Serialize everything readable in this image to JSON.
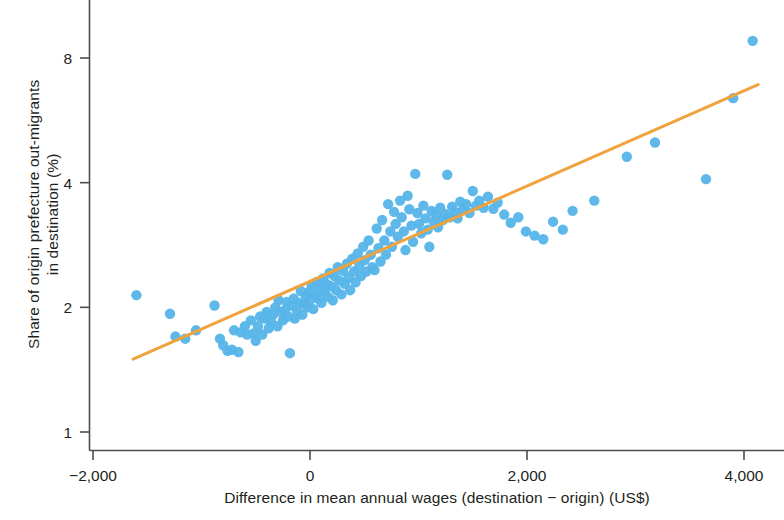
{
  "chart_data": {
    "type": "scatter",
    "title": "",
    "xlabel": "Difference in mean annual wages (destination − origin) (US$)",
    "ylabel": "Share of origin prefecture out-migrants in destination (%)",
    "xlabel_lines": [
      "Difference in mean annual wages (destination − origin) (US$)"
    ],
    "ylabel_lines": [
      "Share of origin prefecture out-migrants",
      "in destination (%)"
    ],
    "xscale": "linear",
    "yscale": "log",
    "xlim": [
      -2450,
      4120
    ],
    "ylim": [
      0.93,
      9.6
    ],
    "xticks": [
      -2000,
      0,
      2000,
      4000
    ],
    "xtick_labels": [
      "−2,000",
      "0",
      "2,000",
      "4,000"
    ],
    "yticks": [
      1,
      2,
      4,
      8
    ],
    "ytick_labels": [
      "1",
      "2",
      "4",
      "8"
    ],
    "grid": false,
    "legend": null,
    "point_color": "#56b4e9",
    "line_color": "#f0a23c",
    "axis_color": "#4d4d4d",
    "marker_size": 8,
    "series": [
      {
        "name": "prefecture pairs",
        "type": "scatter",
        "points": [
          [
            -1600,
            2.14
          ],
          [
            -1290,
            1.93
          ],
          [
            -1240,
            1.7
          ],
          [
            -1150,
            1.68
          ],
          [
            -1050,
            1.76
          ],
          [
            -880,
            2.02
          ],
          [
            -830,
            1.68
          ],
          [
            -800,
            1.62
          ],
          [
            -760,
            1.57
          ],
          [
            -720,
            1.58
          ],
          [
            -700,
            1.76
          ],
          [
            -660,
            1.56
          ],
          [
            -640,
            1.74
          ],
          [
            -600,
            1.8
          ],
          [
            -580,
            1.72
          ],
          [
            -545,
            1.86
          ],
          [
            -520,
            1.73
          ],
          [
            -500,
            1.66
          ],
          [
            -480,
            1.8
          ],
          [
            -460,
            1.9
          ],
          [
            -440,
            1.72
          ],
          [
            -420,
            1.88
          ],
          [
            -400,
            1.95
          ],
          [
            -380,
            1.78
          ],
          [
            -360,
            1.85
          ],
          [
            -340,
            1.92
          ],
          [
            -320,
            2.0
          ],
          [
            -300,
            1.8
          ],
          [
            -290,
            2.08
          ],
          [
            -270,
            1.95
          ],
          [
            -250,
            1.86
          ],
          [
            -230,
            1.97
          ],
          [
            -215,
            2.06
          ],
          [
            -200,
            1.9
          ],
          [
            -185,
            1.55
          ],
          [
            -170,
            2.02
          ],
          [
            -150,
            2.1
          ],
          [
            -140,
            1.88
          ],
          [
            -120,
            1.96
          ],
          [
            -100,
            2.05
          ],
          [
            -85,
            2.19
          ],
          [
            -70,
            1.92
          ],
          [
            -55,
            2.04
          ],
          [
            -40,
            2.12
          ],
          [
            -25,
            2.0
          ],
          [
            -10,
            2.18
          ],
          [
            0,
            2.08
          ],
          [
            15,
            2.26
          ],
          [
            30,
            1.98
          ],
          [
            45,
            2.15
          ],
          [
            60,
            2.3
          ],
          [
            75,
            2.1
          ],
          [
            90,
            2.22
          ],
          [
            105,
            2.05
          ],
          [
            120,
            2.35
          ],
          [
            135,
            2.18
          ],
          [
            150,
            2.28
          ],
          [
            165,
            2.12
          ],
          [
            180,
            2.42
          ],
          [
            195,
            2.25
          ],
          [
            210,
            2.08
          ],
          [
            225,
            2.38
          ],
          [
            240,
            2.2
          ],
          [
            255,
            2.5
          ],
          [
            270,
            2.32
          ],
          [
            290,
            2.15
          ],
          [
            305,
            2.45
          ],
          [
            320,
            2.28
          ],
          [
            340,
            2.55
          ],
          [
            355,
            2.36
          ],
          [
            370,
            2.2
          ],
          [
            390,
            2.62
          ],
          [
            405,
            2.44
          ],
          [
            420,
            2.3
          ],
          [
            440,
            2.7
          ],
          [
            455,
            2.52
          ],
          [
            470,
            2.38
          ],
          [
            490,
            2.8
          ],
          [
            505,
            2.6
          ],
          [
            520,
            2.44
          ],
          [
            540,
            2.9
          ],
          [
            560,
            2.68
          ],
          [
            575,
            2.5
          ],
          [
            595,
            2.46
          ],
          [
            615,
            3.1
          ],
          [
            630,
            2.78
          ],
          [
            650,
            2.58
          ],
          [
            665,
            3.25
          ],
          [
            685,
            2.9
          ],
          [
            700,
            2.68
          ],
          [
            720,
            3.55
          ],
          [
            740,
            3.05
          ],
          [
            755,
            2.8
          ],
          [
            775,
            3.4
          ],
          [
            790,
            3.18
          ],
          [
            810,
            2.96
          ],
          [
            830,
            3.62
          ],
          [
            845,
            3.3
          ],
          [
            865,
            3.05
          ],
          [
            880,
            2.75
          ],
          [
            900,
            3.72
          ],
          [
            915,
            3.45
          ],
          [
            935,
            3.15
          ],
          [
            950,
            2.88
          ],
          [
            970,
            4.2
          ],
          [
            990,
            3.38
          ],
          [
            1005,
            3.18
          ],
          [
            1025,
            3.02
          ],
          [
            1045,
            3.52
          ],
          [
            1065,
            3.28
          ],
          [
            1085,
            3.08
          ],
          [
            1100,
            2.8
          ],
          [
            1120,
            3.42
          ],
          [
            1140,
            3.22
          ],
          [
            1160,
            3.35
          ],
          [
            1180,
            3.12
          ],
          [
            1200,
            3.48
          ],
          [
            1225,
            3.25
          ],
          [
            1245,
            3.36
          ],
          [
            1265,
            4.18
          ],
          [
            1290,
            3.3
          ],
          [
            1310,
            3.5
          ],
          [
            1335,
            3.4
          ],
          [
            1360,
            3.28
          ],
          [
            1385,
            3.6
          ],
          [
            1410,
            3.44
          ],
          [
            1440,
            3.55
          ],
          [
            1470,
            3.38
          ],
          [
            1500,
            3.82
          ],
          [
            1530,
            3.52
          ],
          [
            1560,
            3.62
          ],
          [
            1600,
            3.48
          ],
          [
            1640,
            3.7
          ],
          [
            1690,
            3.46
          ],
          [
            1730,
            3.58
          ],
          [
            1790,
            3.35
          ],
          [
            1850,
            3.2
          ],
          [
            1920,
            3.3
          ],
          [
            1990,
            3.05
          ],
          [
            2070,
            2.98
          ],
          [
            2150,
            2.92
          ],
          [
            2240,
            3.22
          ],
          [
            2330,
            3.08
          ],
          [
            2420,
            3.42
          ],
          [
            2620,
            3.62
          ],
          [
            2920,
            4.62
          ],
          [
            3180,
            5.0
          ],
          [
            3650,
            4.08
          ],
          [
            3900,
            6.4
          ],
          [
            4080,
            8.8
          ]
        ]
      },
      {
        "name": "fitted trend line",
        "type": "line",
        "endpoints": [
          [
            -1630,
            1.5
          ],
          [
            4130,
            6.9
          ]
        ]
      }
    ]
  }
}
